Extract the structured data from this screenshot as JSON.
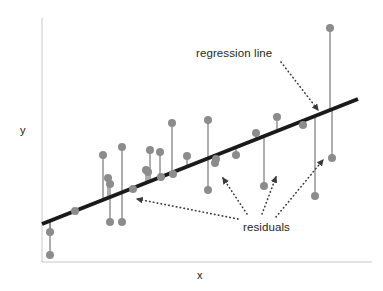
{
  "figure": {
    "background_color": "#ffffff"
  },
  "axes": {
    "x_label": "x",
    "y_label": "y",
    "axis_color": "#c8c8c8",
    "x_axis": {
      "x1": 42,
      "y1": 262,
      "x2": 372,
      "y2": 262
    },
    "y_axis": {
      "x1": 42,
      "y1": 18,
      "x2": 42,
      "y2": 262
    }
  },
  "annotations": [
    {
      "name": "regression-line-label",
      "text": "regression line",
      "arrow": {
        "x1": 281,
        "y1": 62,
        "x2": 318,
        "y2": 110
      }
    },
    {
      "name": "residuals-label",
      "text": "residuals",
      "arrows": [
        {
          "x1": 238,
          "y1": 219,
          "x2": 137,
          "y2": 199
        },
        {
          "x1": 247,
          "y1": 214,
          "x2": 223,
          "y2": 178
        },
        {
          "x1": 262,
          "y1": 214,
          "x2": 276,
          "y2": 177
        },
        {
          "x1": 276,
          "y1": 217,
          "x2": 323,
          "y2": 160
        }
      ]
    }
  ],
  "chart_data": {
    "type": "scatter",
    "title": "",
    "subtitle": "",
    "xlabel": "x",
    "ylabel": "y",
    "xlim": [
      42,
      372
    ],
    "ylim": [
      262,
      18
    ],
    "grid": false,
    "legend": null,
    "point_color": "#8c8c8c",
    "point_radius": 4,
    "residual_color": "#8c8c8c",
    "residual_width": 1.4,
    "regression_line": {
      "label": "regression line",
      "color": "#1a1a1a",
      "width": 4,
      "x1": 42,
      "y1": 224,
      "x2": 358,
      "y2": 99
    },
    "points": [
      {
        "x": 50,
        "y": 255,
        "fit_y": 221
      },
      {
        "x": 50,
        "y": 232,
        "fit_y": 221
      },
      {
        "x": 75,
        "y": 211,
        "fit_y": 211
      },
      {
        "x": 103,
        "y": 155,
        "fit_y": 200
      },
      {
        "x": 108,
        "y": 178,
        "fit_y": 198
      },
      {
        "x": 110,
        "y": 184,
        "fit_y": 197
      },
      {
        "x": 110,
        "y": 222,
        "fit_y": 197
      },
      {
        "x": 122,
        "y": 147,
        "fit_y": 193
      },
      {
        "x": 122,
        "y": 222,
        "fit_y": 193
      },
      {
        "x": 133,
        "y": 189,
        "fit_y": 188
      },
      {
        "x": 146,
        "y": 170,
        "fit_y": 183
      },
      {
        "x": 148,
        "y": 172,
        "fit_y": 182
      },
      {
        "x": 150,
        "y": 150,
        "fit_y": 182
      },
      {
        "x": 160,
        "y": 152,
        "fit_y": 178
      },
      {
        "x": 161,
        "y": 177,
        "fit_y": 177
      },
      {
        "x": 172,
        "y": 123,
        "fit_y": 173
      },
      {
        "x": 173,
        "y": 174,
        "fit_y": 173
      },
      {
        "x": 187,
        "y": 156,
        "fit_y": 167
      },
      {
        "x": 208,
        "y": 120,
        "fit_y": 159
      },
      {
        "x": 208,
        "y": 190,
        "fit_y": 159
      },
      {
        "x": 215,
        "y": 163,
        "fit_y": 156
      },
      {
        "x": 216,
        "y": 159,
        "fit_y": 156
      },
      {
        "x": 236,
        "y": 155,
        "fit_y": 148
      },
      {
        "x": 256,
        "y": 133,
        "fit_y": 140
      },
      {
        "x": 264,
        "y": 186,
        "fit_y": 137
      },
      {
        "x": 277,
        "y": 117,
        "fit_y": 132
      },
      {
        "x": 303,
        "y": 125,
        "fit_y": 121
      },
      {
        "x": 315,
        "y": 196,
        "fit_y": 117
      },
      {
        "x": 330,
        "y": 28,
        "fit_y": 111
      },
      {
        "x": 332,
        "y": 158,
        "fit_y": 110
      }
    ]
  }
}
